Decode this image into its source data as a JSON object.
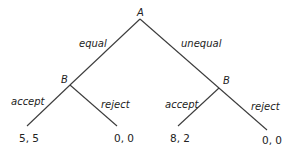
{
  "diagram": {
    "type": "game-tree",
    "root": {
      "id": "A",
      "label": "A"
    },
    "nodes": [
      {
        "id": "B1",
        "label": "B"
      },
      {
        "id": "B2",
        "label": "B"
      }
    ],
    "edges": [
      {
        "from": "A",
        "to": "B1",
        "label": "equal"
      },
      {
        "from": "A",
        "to": "B2",
        "label": "unequal"
      },
      {
        "from": "B1",
        "to": "L1",
        "label": "accept"
      },
      {
        "from": "B1",
        "to": "L2",
        "label": "reject"
      },
      {
        "from": "B2",
        "to": "L3",
        "label": "accept"
      },
      {
        "from": "B2",
        "to": "L4",
        "label": "reject"
      }
    ],
    "payoffs": [
      "5, 5",
      "0, 0",
      "8, 2",
      "0, 0"
    ]
  }
}
